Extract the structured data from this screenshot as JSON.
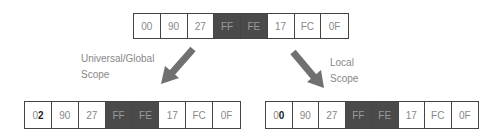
{
  "diagram": {
    "source": {
      "cells": [
        {
          "text": "00",
          "dark": false
        },
        {
          "text": "90",
          "dark": false
        },
        {
          "text": "27",
          "dark": false
        },
        {
          "text": "FF",
          "dark": true
        },
        {
          "text": "FE",
          "dark": true
        },
        {
          "text": "17",
          "dark": false
        },
        {
          "text": "FC",
          "dark": false
        },
        {
          "text": "0F",
          "dark": false
        }
      ]
    },
    "global": {
      "label_line1": "Universal/Global",
      "label_line2": "Scope",
      "first_cell_prefix": "0",
      "first_cell_bold": "2",
      "cells": [
        "90",
        "27",
        "FF",
        "FE",
        "17",
        "FC",
        "0F"
      ]
    },
    "local": {
      "label_line1": "Local",
      "label_line2": "Scope",
      "first_cell_prefix": "0",
      "first_cell_bold": "0",
      "cells": [
        "90",
        "27",
        "FF",
        "FE",
        "17",
        "FC",
        "0F"
      ]
    },
    "colors": {
      "dark_cell": "#4a4a4a",
      "arrow": "#707070",
      "border": "#444444"
    }
  }
}
